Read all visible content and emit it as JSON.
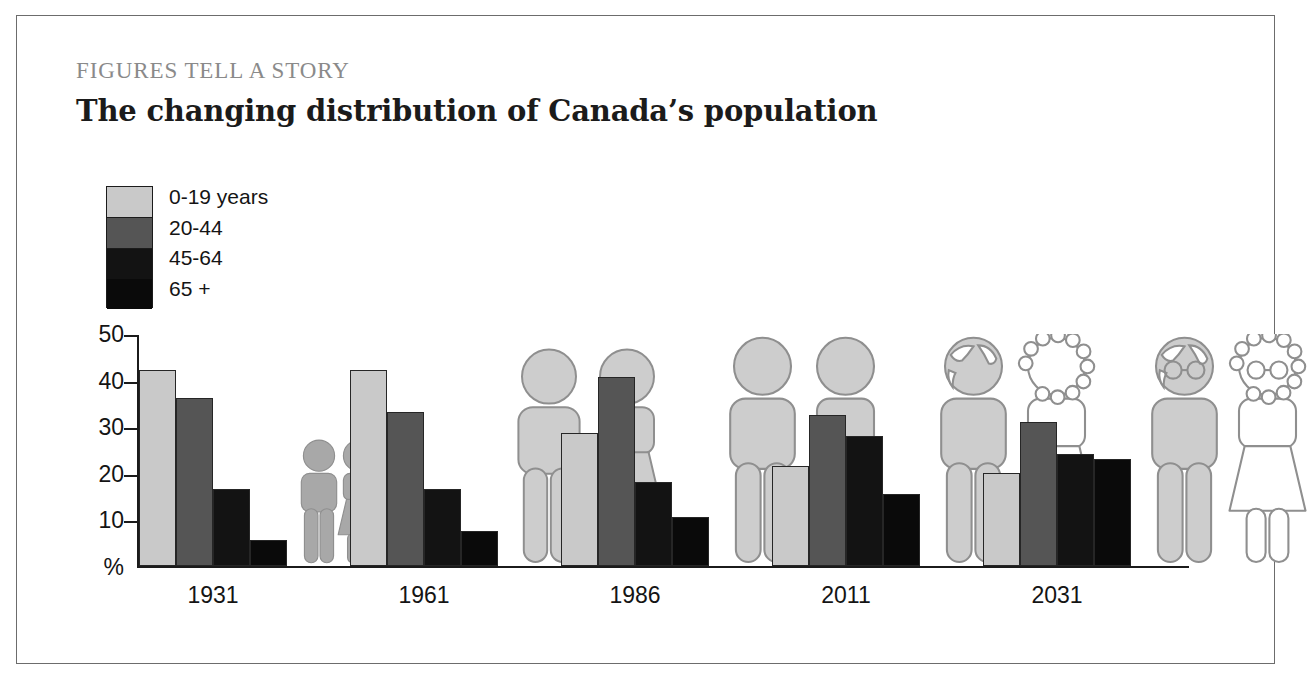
{
  "kicker": "FIGURES TELL A STORY",
  "headline": "The changing distribution of Canada’s population",
  "legend": {
    "items": [
      {
        "label": "0-19 years",
        "color": "#c9c9c9"
      },
      {
        "label": "20-44",
        "color": "#555555"
      },
      {
        "label": "45-64",
        "color": "#131313"
      },
      {
        "label": "65 +",
        "color": "#0a0a0a"
      }
    ]
  },
  "chart_data": {
    "type": "bar",
    "title": "The changing distribution of Canada’s population",
    "xlabel": "",
    "ylabel": "%",
    "ylim": [
      0,
      50
    ],
    "ytick_labels": [
      "50",
      "40",
      "30",
      "20",
      "10",
      "%"
    ],
    "yticks": [
      50,
      40,
      30,
      20,
      10,
      0
    ],
    "grid": false,
    "legend_position": "top-left",
    "categories": [
      "1931",
      "1961",
      "1986",
      "2011",
      "2031"
    ],
    "series": [
      {
        "name": "0-19 years",
        "color": "#c9c9c9",
        "values": [
          42,
          42,
          28.5,
          21.5,
          20
        ]
      },
      {
        "name": "20-44",
        "color": "#555555",
        "values": [
          36,
          33,
          40.5,
          32.5,
          31
        ]
      },
      {
        "name": "45-64",
        "color": "#131313",
        "values": [
          16.5,
          16.5,
          18,
          28,
          24
        ]
      },
      {
        "name": "65 +",
        "color": "#0a0a0a",
        "values": [
          5.5,
          7.5,
          10.5,
          15.5,
          23
        ]
      }
    ],
    "pictograms": [
      {
        "year": "1931",
        "scale": 0.52,
        "male_head": "plain",
        "female_head": "plain",
        "male_fill": "#a8a8a8",
        "female_fill": "#a8a8a8"
      },
      {
        "year": "1961",
        "scale": 0.9,
        "male_head": "plain",
        "female_head": "plain",
        "male_fill": "#cdcdcd",
        "female_fill": "#cdcdcd"
      },
      {
        "year": "1986",
        "scale": 0.95,
        "male_head": "plain",
        "female_head": "plain",
        "male_fill": "#cdcdcd",
        "female_fill": "#cdcdcd"
      },
      {
        "year": "2011",
        "scale": 0.95,
        "male_head": "balding",
        "female_head": "curly",
        "male_fill": "#cdcdcd",
        "female_fill": "#ffffff"
      },
      {
        "year": "2031",
        "scale": 0.95,
        "male_head": "balding-glasses",
        "female_head": "curly-glasses",
        "male_fill": "#cdcdcd",
        "female_fill": "#ffffff"
      }
    ]
  }
}
